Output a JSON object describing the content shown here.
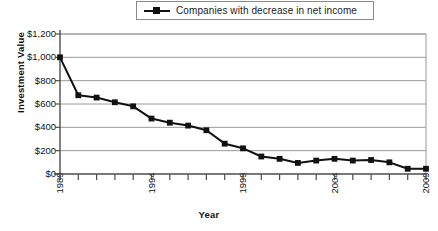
{
  "chart_data": {
    "type": "line",
    "title": "",
    "xlabel": "Year",
    "ylabel": "Investment Value",
    "legend_position": "top-center",
    "grid": "horizontal",
    "xlim": [
      1989,
      2009
    ],
    "ylim": [
      0,
      1200
    ],
    "y_ticks": [
      0,
      200,
      400,
      600,
      800,
      1000,
      1200
    ],
    "y_tick_labels": [
      "$0",
      "$200",
      "$400",
      "$600",
      "$800",
      "$1,000",
      "$1,200"
    ],
    "x_ticks": [
      1989,
      1990,
      1991,
      1992,
      1993,
      1994,
      1995,
      1996,
      1997,
      1998,
      1999,
      2000,
      2001,
      2002,
      2003,
      2004,
      2005,
      2006,
      2007,
      2008,
      2009
    ],
    "x_tick_labels_shown": [
      "1989",
      "1994",
      "1999",
      "2004",
      "2009"
    ],
    "x": [
      1989,
      1990,
      1991,
      1992,
      1993,
      1994,
      1995,
      1996,
      1997,
      1998,
      1999,
      2000,
      2001,
      2002,
      2003,
      2004,
      2005,
      2006,
      2007,
      2008,
      2009
    ],
    "series": [
      {
        "name": "Companies with decrease in net income",
        "color": "#111111",
        "marker": "square",
        "values": [
          1000,
          675,
          655,
          615,
          580,
          475,
          440,
          415,
          375,
          260,
          220,
          150,
          130,
          95,
          115,
          130,
          115,
          120,
          100,
          45,
          45
        ]
      }
    ]
  },
  "legend": {
    "entries": [
      {
        "label": "Companies with decrease in net income",
        "marker": "square-line-marker"
      }
    ]
  },
  "axes": {
    "y_title": "Investment Value",
    "x_title": "Year"
  },
  "colors": {
    "series": "#111111",
    "gridline": "#9a9a9a",
    "axis": "#4d4d4d",
    "legend_border": "#8a8a8a",
    "background": "#ffffff"
  }
}
